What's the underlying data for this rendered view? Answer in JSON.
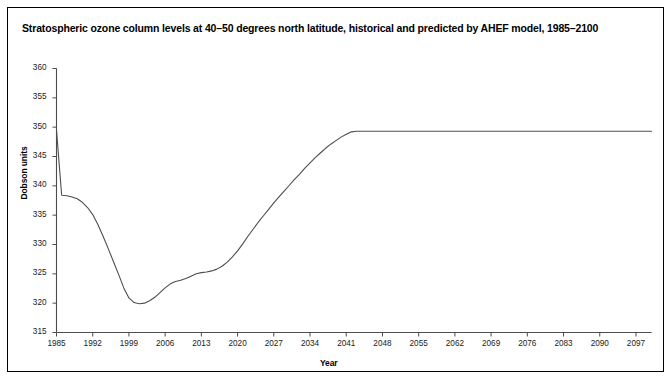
{
  "title": "Stratospheric ozone column levels at 40–50 degrees north latitude, historical and predicted by AHEF model, 1985–2100",
  "axes": {
    "xlabel": "Year",
    "ylabel": "Dobson units"
  },
  "chart_data": {
    "type": "line",
    "title": "Stratospheric ozone column levels at 40–50 degrees north latitude, historical and predicted by AHEF model, 1985–2100",
    "xlabel": "Year",
    "ylabel": "Dobson units",
    "xlim": [
      1985,
      2100
    ],
    "ylim": [
      315,
      360
    ],
    "xticks": [
      1985,
      1992,
      1999,
      2006,
      2013,
      2020,
      2027,
      2034,
      2041,
      2048,
      2055,
      2062,
      2069,
      2076,
      2083,
      2090,
      2097
    ],
    "yticks": [
      315,
      320,
      325,
      330,
      335,
      340,
      345,
      350,
      355,
      360
    ],
    "grid": false,
    "legend": null,
    "line_color": "#4d4d4d",
    "series": [
      {
        "name": "Ozone column (AHEF model)",
        "x": [
          1985,
          1986,
          1987,
          1988,
          1989,
          1990,
          1991,
          1992,
          1993,
          1994,
          1995,
          1996,
          1997,
          1998,
          1999,
          2000,
          2001,
          2002,
          2003,
          2004,
          2005,
          2006,
          2007,
          2008,
          2009,
          2010,
          2011,
          2012,
          2013,
          2014,
          2015,
          2016,
          2017,
          2018,
          2019,
          2020,
          2021,
          2022,
          2023,
          2024,
          2025,
          2026,
          2027,
          2028,
          2029,
          2030,
          2031,
          2032,
          2033,
          2034,
          2035,
          2036,
          2037,
          2038,
          2039,
          2040,
          2041,
          2042,
          2043,
          2044,
          2045,
          2050,
          2055,
          2060,
          2065,
          2070,
          2075,
          2080,
          2085,
          2090,
          2095,
          2100
        ],
        "y": [
          349.5,
          338.4,
          338.3,
          338.1,
          337.8,
          337.2,
          336.3,
          335.1,
          333.4,
          331.4,
          329.3,
          327.1,
          324.9,
          322.6,
          320.9,
          320.1,
          319.9,
          320.0,
          320.4,
          321.0,
          321.8,
          322.6,
          323.3,
          323.7,
          323.9,
          324.2,
          324.6,
          325.0,
          325.2,
          325.3,
          325.5,
          325.8,
          326.3,
          327.0,
          327.9,
          328.9,
          330.1,
          331.4,
          332.6,
          333.8,
          334.9,
          336.0,
          337.1,
          338.1,
          339.1,
          340.1,
          341.1,
          342.0,
          343.0,
          343.9,
          344.8,
          345.6,
          346.4,
          347.1,
          347.7,
          348.3,
          348.8,
          349.2,
          349.3,
          349.3,
          349.3,
          349.3,
          349.3,
          349.3,
          349.3,
          349.3,
          349.3,
          349.3,
          349.3,
          349.3,
          349.3,
          349.3
        ]
      }
    ],
    "annotations": {
      "start_value": 349.5,
      "minimum_value": 319.9,
      "minimum_year": 2001,
      "plateau_value": 349.3,
      "plateau_start_year": 2043
    }
  }
}
